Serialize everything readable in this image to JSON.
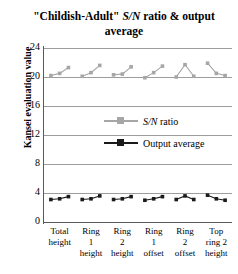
{
  "chart_data": {
    "type": "line",
    "title": "\"Childish-Adult\" S/N ratio & output average",
    "title_plain": "\"Childish-Adult\"",
    "title_italic": "S/N",
    "title_tail": "ratio &",
    "title_line2": "output average",
    "xlabel": "",
    "ylabel": "Kansei evaluation value",
    "ylim": [
      0,
      24
    ],
    "yticks": [
      0,
      4,
      8,
      12,
      16,
      20,
      24
    ],
    "grid": true,
    "legend_position": "center-right",
    "categories": [
      "Total height",
      "Ring 1 height",
      "Ring 2 height",
      "Ring 1 offset",
      "Ring 2 offset",
      "Top ring 2 height"
    ],
    "category_lines": [
      [
        "Total",
        "height",
        ""
      ],
      [
        "Ring",
        "1",
        "height"
      ],
      [
        "Ring",
        "2",
        "height"
      ],
      [
        "Ring",
        "1",
        "offset"
      ],
      [
        "Ring",
        "2",
        "offset"
      ],
      [
        "Top",
        "ring 2",
        "height"
      ]
    ],
    "levels_per_category": 3,
    "series": [
      {
        "name": "S/N ratio",
        "name_italic": "S/N",
        "name_tail": "ratio",
        "color": "#a6a6a6",
        "marker": "square",
        "groups": [
          [
            20.2,
            20.5,
            21.3
          ],
          [
            20.1,
            20.6,
            21.6
          ],
          [
            20.3,
            20.4,
            21.4
          ],
          [
            19.9,
            20.6,
            21.5
          ],
          [
            20.0,
            21.7,
            20.1
          ],
          [
            21.9,
            20.5,
            20.2
          ]
        ]
      },
      {
        "name": "Output average",
        "color": "#1a1a1a",
        "marker": "square",
        "groups": [
          [
            3.1,
            3.2,
            3.5
          ],
          [
            3.1,
            3.2,
            3.6
          ],
          [
            3.1,
            3.2,
            3.5
          ],
          [
            3.0,
            3.2,
            3.5
          ],
          [
            3.1,
            3.6,
            3.1
          ],
          [
            3.7,
            3.2,
            3.0
          ]
        ]
      }
    ]
  }
}
